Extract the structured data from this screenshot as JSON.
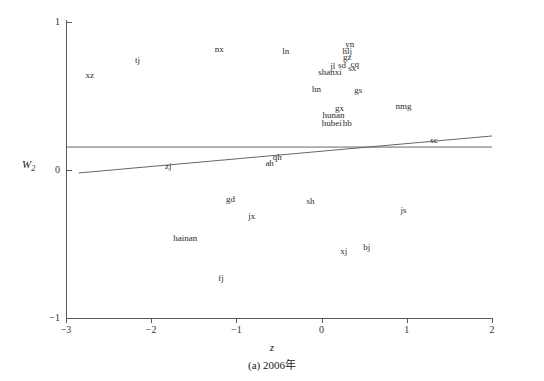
{
  "chart_data": {
    "type": "scatter",
    "title": "",
    "caption": "(a) 2006年",
    "xlabel": "z",
    "ylabel": "W2",
    "ylabel_base": "W",
    "ylabel_sub": "2",
    "xlim": [
      -3,
      2
    ],
    "ylim": [
      -1,
      1
    ],
    "xticks": [
      -3,
      -2,
      -1,
      0,
      1,
      2
    ],
    "xticklabels": [
      "−3",
      "−2",
      "−1",
      "0",
      "1",
      "2"
    ],
    "yticks": [
      -1,
      0,
      1
    ],
    "yticklabels": [
      "−1",
      "0",
      "1"
    ],
    "grid": false,
    "legend": null,
    "marker_style": "text-label-only",
    "points": [
      {
        "label": "xz",
        "x": -2.72,
        "y": 0.645
      },
      {
        "label": "tj",
        "x": -2.16,
        "y": 0.74
      },
      {
        "label": "nx",
        "x": -1.2,
        "y": 0.815
      },
      {
        "label": "ln",
        "x": -0.42,
        "y": 0.805
      },
      {
        "label": "yn",
        "x": 0.33,
        "y": 0.85
      },
      {
        "label": "hlj",
        "x": 0.3,
        "y": 0.805
      },
      {
        "label": "gz",
        "x": 0.3,
        "y": 0.762
      },
      {
        "label": "jl",
        "x": 0.13,
        "y": 0.7
      },
      {
        "label": "sd",
        "x": 0.24,
        "y": 0.712
      },
      {
        "label": "cq",
        "x": 0.39,
        "y": 0.715
      },
      {
        "label": "sx",
        "x": 0.36,
        "y": 0.688
      },
      {
        "label": "shanxi",
        "x": 0.1,
        "y": 0.66
      },
      {
        "label": "hn",
        "x": -0.06,
        "y": 0.545
      },
      {
        "label": "gs",
        "x": 0.43,
        "y": 0.54
      },
      {
        "label": "nmg",
        "x": 0.96,
        "y": 0.435
      },
      {
        "label": "gx",
        "x": 0.21,
        "y": 0.42
      },
      {
        "label": "hunan",
        "x": 0.14,
        "y": 0.372
      },
      {
        "label": "hubei",
        "x": 0.12,
        "y": 0.32
      },
      {
        "label": "hb",
        "x": 0.3,
        "y": 0.318
      },
      {
        "label": "sc",
        "x": 1.32,
        "y": 0.205
      },
      {
        "label": "qh",
        "x": -0.52,
        "y": 0.09
      },
      {
        "label": "ah",
        "x": -0.61,
        "y": 0.05
      },
      {
        "label": "zj",
        "x": -1.8,
        "y": 0.03
      },
      {
        "label": "gd",
        "x": -1.07,
        "y": -0.195
      },
      {
        "label": "sh",
        "x": -0.13,
        "y": -0.21
      },
      {
        "label": "js",
        "x": 0.96,
        "y": -0.27
      },
      {
        "label": "jx",
        "x": -0.82,
        "y": -0.31
      },
      {
        "label": "hainan",
        "x": -1.6,
        "y": -0.46
      },
      {
        "label": "bj",
        "x": 0.53,
        "y": -0.52
      },
      {
        "label": "xj",
        "x": 0.26,
        "y": -0.545
      },
      {
        "label": "fj",
        "x": -1.18,
        "y": -0.73
      }
    ],
    "lines": [
      {
        "name": "horizontal-reference-line",
        "kind": "horizontal",
        "y": 0.155,
        "x_start": -3.0,
        "x_end": 2.0
      },
      {
        "name": "regression-line",
        "kind": "sloped",
        "x_start": -2.85,
        "y_start": -0.02,
        "x_end": 2.0,
        "y_end": 0.23
      }
    ],
    "axis_color": "#5a5a5a",
    "line_color": "#555555",
    "label_color": "#2b2b2b"
  }
}
